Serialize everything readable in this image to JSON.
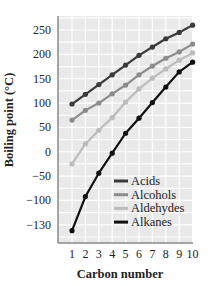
{
  "chart_data": {
    "type": "line",
    "title": "",
    "xlabel": "Carbon number",
    "ylabel": "Boiling point (°C)",
    "x": [
      1,
      2,
      3,
      4,
      5,
      6,
      7,
      8,
      9,
      10
    ],
    "x_tick_labels": [
      "1",
      "2",
      "3",
      "4",
      "5",
      "6",
      "7",
      "8",
      "9",
      "10"
    ],
    "y_tick_labels": [
      "250",
      "200",
      "150",
      "100",
      "50",
      "0",
      "−50",
      "−100",
      "−130"
    ],
    "y_tick_values": [
      250,
      200,
      150,
      100,
      50,
      0,
      -50,
      -100,
      -150
    ],
    "ylim": [
      -172,
      278
    ],
    "xlim": [
      0.05,
      10.1
    ],
    "grid": true,
    "legend_position": "lower right (inside)",
    "series": [
      {
        "name": "Acids",
        "color": "#3a3a3a",
        "values": [
          98,
          118,
          138,
          158,
          178,
          198,
          215,
          232,
          245,
          260
        ]
      },
      {
        "name": "Alcohols",
        "color": "#8c8c8c",
        "values": [
          65,
          85,
          100,
          119,
          137,
          158,
          176,
          192,
          205,
          221
        ]
      },
      {
        "name": "Aldehydes",
        "color": "#bcbcbc",
        "values": [
          -25,
          16,
          44,
          70,
          102,
          129,
          151,
          170,
          188,
          203
        ]
      },
      {
        "name": "Alkanes",
        "color": "#111111",
        "values": [
          -162,
          -92,
          -44,
          -3,
          38,
          69,
          101,
          133,
          164,
          184
        ]
      }
    ]
  },
  "style": {
    "plot_background": "#e9e9e9",
    "grid_color": "#ffffff",
    "axis_color": "#8a8a8a"
  }
}
